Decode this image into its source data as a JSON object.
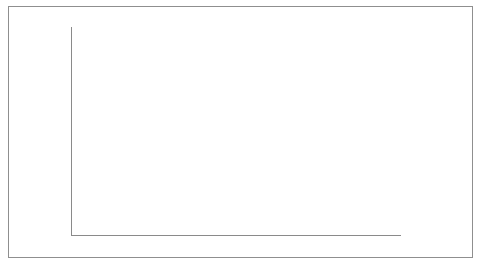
{
  "chart_data": {
    "type": "bar",
    "stacked": true,
    "title": "",
    "xlabel": "年份",
    "ylabel": "生态公益林、商品林面积占比(%)",
    "categories": [
      "2004",
      "2005",
      "2006",
      "2007",
      "2008",
      "2009",
      "2010",
      "2011",
      "2012",
      "2013"
    ],
    "ylim": [
      0,
      100
    ],
    "ytick_labels": [
      "100%",
      "90%",
      "80%",
      "70%",
      "60%",
      "50%",
      "40%",
      "30%",
      "20%",
      "10%",
      "0%"
    ],
    "ytick_values": [
      100,
      90,
      80,
      70,
      60,
      50,
      40,
      30,
      20,
      10,
      0
    ],
    "grid": false,
    "legend_position": "right",
    "series": [
      {
        "name": "商品林",
        "color": "#e2e2e0",
        "values": [
          67,
          67,
          66.5,
          66.5,
          66.5,
          66,
          64,
          63,
          62,
          61
        ]
      },
      {
        "name": "生态公益林",
        "color": "#7d7d7d",
        "values": [
          33,
          33,
          33.5,
          33.5,
          33.5,
          34,
          36,
          37,
          38,
          39
        ]
      }
    ]
  },
  "axis": {
    "y_title": "生态公益林、商品林面积占比(%)",
    "x_title": "年份"
  },
  "legend": {
    "items": [
      {
        "label": "商品林",
        "color": "#e2e2e0"
      },
      {
        "label": "生态公益林",
        "color": "#7d7d7d"
      }
    ]
  }
}
